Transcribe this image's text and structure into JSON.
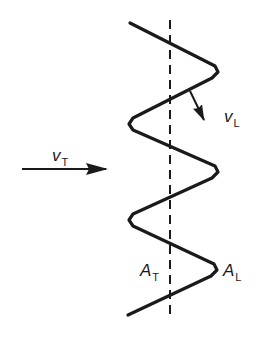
{
  "diagram": {
    "background": "#ffffff",
    "stroke_color": "#1a1a1a",
    "wave_path_points": [
      [
        130,
        23
      ],
      [
        215,
        66
      ],
      [
        218,
        72
      ],
      [
        212,
        78
      ],
      [
        133,
        118
      ],
      [
        129,
        124
      ],
      [
        133,
        130
      ],
      [
        215,
        166
      ],
      [
        218,
        172
      ],
      [
        212,
        178
      ],
      [
        133,
        214
      ],
      [
        129,
        220
      ],
      [
        133,
        226
      ],
      [
        214,
        264
      ],
      [
        217,
        270
      ],
      [
        211,
        276
      ],
      [
        128,
        315
      ]
    ],
    "axis_line": {
      "x": 170,
      "y1": 20,
      "y2": 318,
      "dash": "9,6"
    },
    "arrows": {
      "transverse_velocity": {
        "x1": 22,
        "y1": 169,
        "x2": 106,
        "y2": 169
      },
      "longitudinal_velocity": {
        "x1": 190,
        "y1": 91,
        "x2": 204,
        "y2": 120
      }
    },
    "labels": {
      "vt": {
        "main": "v",
        "sub": "T"
      },
      "vl": {
        "main": "v",
        "sub": "L"
      },
      "at": {
        "main": "A",
        "sub": "T"
      },
      "al": {
        "main": "A",
        "sub": "L"
      }
    }
  }
}
